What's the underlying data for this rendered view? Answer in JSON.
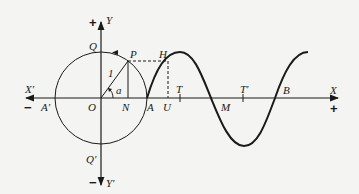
{
  "diagram": {
    "type": "unit-circle-sine-wave",
    "colors": {
      "ink": "#1a1a1a",
      "background": "#f4f4f2"
    },
    "axes": {
      "x_positive_label": "X",
      "x_negative_label": "X'",
      "y_positive_label": "Y",
      "y_negative_label": "Y'",
      "plus_sign": "+",
      "minus_sign": "−"
    },
    "circle": {
      "center_label": "O",
      "radius_label": "1",
      "angle_label": "a",
      "points": {
        "P": "P",
        "N": "N",
        "Q": "Q",
        "Q_prime": "Q'",
        "A": "A",
        "A_prime": "A'"
      }
    },
    "wave": {
      "points": {
        "H": "H",
        "U": "U",
        "T": "T",
        "T_prime": "T'",
        "M": "M",
        "B": "B"
      }
    }
  }
}
